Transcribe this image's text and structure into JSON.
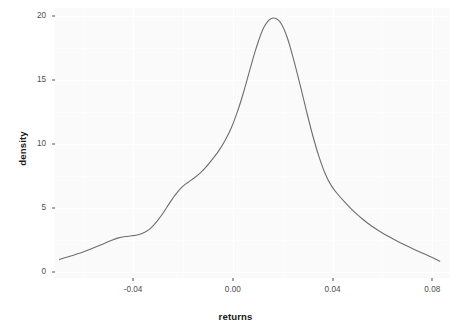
{
  "chart_data": {
    "type": "line",
    "title": "",
    "subtitle": "",
    "xlabel": "returns",
    "ylabel": "density",
    "xlim": [
      -0.0713,
      0.0871
    ],
    "ylim": [
      -0.45,
      20.6
    ],
    "grid": true,
    "legend": null,
    "series": [
      {
        "name": "density",
        "color": "#6e6e6e",
        "line_width": 1.1,
        "x": [
          -0.0695,
          -0.066,
          -0.0625,
          -0.059,
          -0.0555,
          -0.052,
          -0.0485,
          -0.0455,
          -0.043,
          -0.0405,
          -0.038,
          -0.0355,
          -0.033,
          -0.0305,
          -0.028,
          -0.0255,
          -0.023,
          -0.0205,
          -0.018,
          -0.0155,
          -0.013,
          -0.0105,
          -0.008,
          -0.0055,
          -0.003,
          -0.0005,
          0.002,
          0.0045,
          0.007,
          0.0095,
          0.012,
          0.0145,
          0.017,
          0.0195,
          0.022,
          0.0245,
          0.027,
          0.0295,
          0.032,
          0.0345,
          0.037,
          0.0395,
          0.042,
          0.045,
          0.0485,
          0.052,
          0.0555,
          0.059,
          0.0625,
          0.066,
          0.0695,
          0.073,
          0.0765,
          0.08,
          0.083
        ],
        "y": [
          1.0,
          1.2,
          1.42,
          1.66,
          1.92,
          2.2,
          2.5,
          2.7,
          2.78,
          2.84,
          2.92,
          3.1,
          3.42,
          3.95,
          4.6,
          5.35,
          6.05,
          6.62,
          7.0,
          7.35,
          7.75,
          8.25,
          8.85,
          9.5,
          10.3,
          11.3,
          12.6,
          14.15,
          15.9,
          17.55,
          18.9,
          19.65,
          19.8,
          19.35,
          18.2,
          16.5,
          14.6,
          12.6,
          10.7,
          9.05,
          7.7,
          6.75,
          6.1,
          5.45,
          4.75,
          4.15,
          3.62,
          3.18,
          2.78,
          2.42,
          2.08,
          1.76,
          1.46,
          1.15,
          0.86
        ]
      }
    ],
    "x_ticks": [
      {
        "value": -0.04,
        "label": "-0.04"
      },
      {
        "value": 0.0,
        "label": "0.00"
      },
      {
        "value": 0.04,
        "label": "0.04"
      },
      {
        "value": 0.08,
        "label": "0.08"
      }
    ],
    "y_ticks": [
      {
        "value": 0,
        "label": "0"
      },
      {
        "value": 5,
        "label": "5"
      },
      {
        "value": 10,
        "label": "10"
      },
      {
        "value": 15,
        "label": "15"
      },
      {
        "value": 20,
        "label": "20"
      }
    ],
    "x_minor_ticks": [
      -0.06,
      -0.02,
      0.02,
      0.06
    ],
    "y_minor_ticks": [
      2.5,
      7.5,
      12.5,
      17.5
    ],
    "colors": {
      "panel_background": "#fafafa",
      "figure_background": "#ffffff",
      "gridline": "#ffffff",
      "line": "#6e6e6e",
      "tick_text": "#4d4d4d",
      "axis_title": "#1a1a1a"
    }
  }
}
